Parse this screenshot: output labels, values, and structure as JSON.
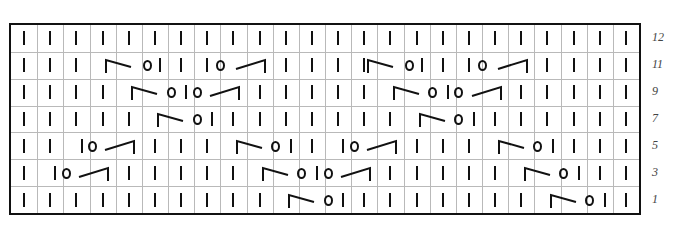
{
  "chart": {
    "columns": 24,
    "rows_shown": 7,
    "legend_codes": {
      "k": "knit (vertical bar)",
      "o": "yarn over (circle)",
      "l": "left-leaning decrease (corner + slash down-right)",
      "r": "right-leaning decrease (slash up-right + corner)"
    },
    "rows": [
      {
        "label": "12",
        "tokens": [
          [
            "k",
            1
          ],
          [
            "k",
            2
          ],
          [
            "k",
            3
          ],
          [
            "k",
            4
          ],
          [
            "k",
            5
          ],
          [
            "k",
            6
          ],
          [
            "k",
            7
          ],
          [
            "k",
            8
          ],
          [
            "k",
            9
          ],
          [
            "k",
            10
          ],
          [
            "k",
            11
          ],
          [
            "k",
            12
          ],
          [
            "k",
            13
          ],
          [
            "k",
            14
          ],
          [
            "k",
            15
          ],
          [
            "k",
            16
          ],
          [
            "k",
            17
          ],
          [
            "k",
            18
          ],
          [
            "k",
            19
          ],
          [
            "k",
            20
          ],
          [
            "k",
            21
          ],
          [
            "k",
            22
          ],
          [
            "k",
            23
          ],
          [
            "k",
            24
          ]
        ]
      },
      {
        "label": "11",
        "tokens": [
          [
            "k",
            1
          ],
          [
            "k",
            2
          ],
          [
            "k",
            3
          ],
          [
            "l",
            4.4
          ],
          [
            "o",
            5.7
          ],
          [
            "k",
            6.2
          ],
          [
            "k",
            7
          ],
          [
            "k",
            8
          ],
          [
            "o",
            8.5
          ],
          [
            "r",
            9.3
          ],
          [
            "k",
            11
          ],
          [
            "k",
            12
          ],
          [
            "k",
            13
          ],
          [
            "k",
            14
          ],
          [
            "l",
            14.4
          ],
          [
            "o",
            15.7
          ],
          [
            "k",
            16.2
          ],
          [
            "k",
            17
          ],
          [
            "k",
            18
          ],
          [
            "o",
            18.5
          ],
          [
            "r",
            19.3
          ],
          [
            "k",
            21
          ],
          [
            "k",
            22
          ],
          [
            "k",
            23
          ],
          [
            "k",
            24
          ]
        ]
      },
      {
        "label": "9",
        "tokens": [
          [
            "k",
            1
          ],
          [
            "k",
            2
          ],
          [
            "k",
            3
          ],
          [
            "k",
            4
          ],
          [
            "l",
            5.4
          ],
          [
            "o",
            6.6
          ],
          [
            "k",
            7.2
          ],
          [
            "o",
            7.6
          ],
          [
            "r",
            8.3
          ],
          [
            "k",
            10
          ],
          [
            "k",
            11
          ],
          [
            "k",
            12
          ],
          [
            "k",
            13
          ],
          [
            "k",
            14
          ],
          [
            "l",
            15.4
          ],
          [
            "o",
            16.6
          ],
          [
            "k",
            17.2
          ],
          [
            "o",
            17.6
          ],
          [
            "r",
            18.3
          ],
          [
            "k",
            20
          ],
          [
            "k",
            21
          ],
          [
            "k",
            22
          ],
          [
            "k",
            23
          ],
          [
            "k",
            24
          ]
        ]
      },
      {
        "label": "7",
        "tokens": [
          [
            "k",
            1
          ],
          [
            "k",
            2
          ],
          [
            "k",
            3
          ],
          [
            "k",
            4
          ],
          [
            "k",
            5
          ],
          [
            "l",
            6.4
          ],
          [
            "o",
            7.6
          ],
          [
            "k",
            8.2
          ],
          [
            "k",
            9
          ],
          [
            "k",
            10
          ],
          [
            "k",
            11
          ],
          [
            "k",
            12
          ],
          [
            "k",
            13
          ],
          [
            "k",
            14
          ],
          [
            "k",
            15
          ],
          [
            "l",
            16.4
          ],
          [
            "o",
            17.6
          ],
          [
            "k",
            18.2
          ],
          [
            "k",
            19
          ],
          [
            "k",
            20
          ],
          [
            "k",
            21
          ],
          [
            "k",
            22
          ],
          [
            "k",
            23
          ],
          [
            "k",
            24
          ]
        ]
      },
      {
        "label": "5",
        "tokens": [
          [
            "k",
            1
          ],
          [
            "k",
            2
          ],
          [
            "k",
            3.2
          ],
          [
            "o",
            3.6
          ],
          [
            "r",
            4.3
          ],
          [
            "k",
            6
          ],
          [
            "k",
            7
          ],
          [
            "k",
            8
          ],
          [
            "l",
            9.4
          ],
          [
            "o",
            10.6
          ],
          [
            "k",
            11.2
          ],
          [
            "k",
            12
          ],
          [
            "k",
            13.2
          ],
          [
            "o",
            13.6
          ],
          [
            "r",
            14.3
          ],
          [
            "k",
            16
          ],
          [
            "k",
            17
          ],
          [
            "k",
            18
          ],
          [
            "l",
            19.4
          ],
          [
            "o",
            20.6
          ],
          [
            "k",
            21.2
          ],
          [
            "k",
            22
          ],
          [
            "k",
            23
          ],
          [
            "k",
            24
          ]
        ]
      },
      {
        "label": "3",
        "tokens": [
          [
            "k",
            1
          ],
          [
            "k",
            2.2
          ],
          [
            "o",
            2.6
          ],
          [
            "r",
            3.3
          ],
          [
            "k",
            5
          ],
          [
            "k",
            6
          ],
          [
            "k",
            7
          ],
          [
            "k",
            8
          ],
          [
            "k",
            9
          ],
          [
            "l",
            10.4
          ],
          [
            "o",
            11.6
          ],
          [
            "k",
            12.2
          ],
          [
            "o",
            12.6
          ],
          [
            "r",
            13.3
          ],
          [
            "k",
            15
          ],
          [
            "k",
            16
          ],
          [
            "k",
            17
          ],
          [
            "k",
            18
          ],
          [
            "k",
            19
          ],
          [
            "l",
            20.4
          ],
          [
            "o",
            21.6
          ],
          [
            "k",
            22.2
          ],
          [
            "k",
            23
          ],
          [
            "k",
            24
          ]
        ]
      },
      {
        "label": "1",
        "tokens": [
          [
            "k",
            1
          ],
          [
            "k",
            2
          ],
          [
            "k",
            3
          ],
          [
            "k",
            4
          ],
          [
            "k",
            5
          ],
          [
            "k",
            6
          ],
          [
            "k",
            7
          ],
          [
            "k",
            8
          ],
          [
            "k",
            9
          ],
          [
            "k",
            10
          ],
          [
            "l",
            11.4
          ],
          [
            "o",
            12.6
          ],
          [
            "k",
            13.2
          ],
          [
            "k",
            14
          ],
          [
            "k",
            15
          ],
          [
            "k",
            16
          ],
          [
            "k",
            17
          ],
          [
            "k",
            18
          ],
          [
            "k",
            19
          ],
          [
            "k",
            20
          ],
          [
            "l",
            21.4
          ],
          [
            "o",
            22.6
          ],
          [
            "k",
            23.2
          ],
          [
            "k",
            24
          ]
        ]
      }
    ]
  }
}
